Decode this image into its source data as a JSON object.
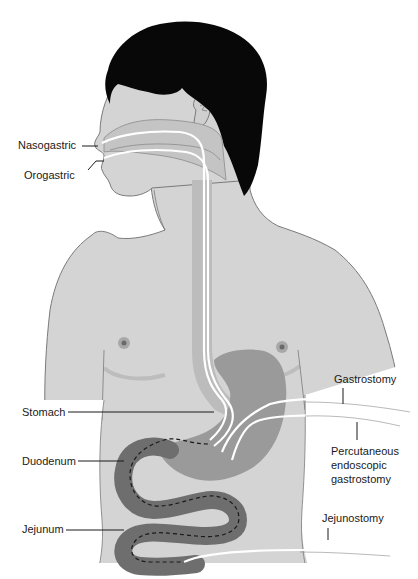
{
  "diagram": {
    "colors": {
      "skin": "#d4d4d4",
      "skin_outline": "#7a7a7a",
      "hair": "#080808",
      "organ_stomach": "#9a9a9a",
      "organ_intestine": "#6e6e6e",
      "tube": "#ffffff",
      "label_text": "#1a1a1a"
    },
    "labels": {
      "nasogastric": "Nasogastric",
      "orogastric": "Orogastric",
      "stomach": "Stomach",
      "duodenum": "Duodenum",
      "jejunum": "Jejunum",
      "gastrostomy": "Gastrostomy",
      "peg_line1": "Percutaneous",
      "peg_line2": "endoscopic",
      "peg_line3": "gastrostomy",
      "jejunostomy": "Jejunostomy"
    }
  }
}
